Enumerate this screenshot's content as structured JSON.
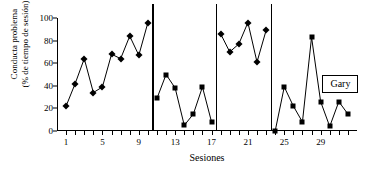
{
  "chart_data": {
    "type": "line",
    "title": "",
    "xlabel": "Sesiones",
    "ylabel": "Conducta problema (% de tiempo de sesión)",
    "ylabel_line1": "Conducta problema",
    "ylabel_line2": "(% de tiempo de sesión)",
    "xlim": [
      0,
      33
    ],
    "ylim": [
      0,
      100
    ],
    "yticks": [
      0,
      20,
      40,
      60,
      80,
      100
    ],
    "xticks_labeled": [
      1,
      5,
      9,
      13,
      17,
      21,
      25,
      29
    ],
    "xticks_all": [
      1,
      2,
      3,
      4,
      5,
      6,
      7,
      8,
      9,
      10,
      11,
      12,
      13,
      14,
      15,
      16,
      17,
      18,
      19,
      20,
      21,
      22,
      23,
      24,
      25,
      26,
      27,
      28,
      29,
      30,
      31,
      32
    ],
    "grid": false,
    "legend_position": "inside-right",
    "annotation": "Gary",
    "series": [
      {
        "name": "Conducta problema",
        "x": [
          1,
          2,
          3,
          4,
          5,
          6,
          7,
          8,
          9,
          10,
          11,
          12,
          13,
          14,
          15,
          16,
          17,
          18,
          19,
          20,
          21,
          22,
          23,
          24,
          25,
          26,
          27,
          28,
          29,
          30,
          31,
          32
        ],
        "values": [
          22,
          42,
          64,
          34,
          39,
          68,
          64,
          84,
          67,
          96,
          29,
          50,
          38,
          5,
          15,
          39,
          8,
          86,
          70,
          77,
          96,
          61,
          89,
          0,
          39,
          22,
          8,
          83,
          26,
          4,
          26,
          15
        ]
      }
    ],
    "phases": [
      {
        "label": "No E",
        "start": 1,
        "end": 10,
        "marker": "diamond"
      },
      {
        "label": "E",
        "start": 11,
        "end": 17,
        "marker": "square"
      },
      {
        "label": "No E",
        "start": 18,
        "end": 23,
        "marker": "diamond"
      },
      {
        "label": "E",
        "start": 24,
        "end": 32,
        "marker": "square"
      }
    ],
    "phase_dividers": [
      10.5,
      17.5,
      23.5
    ],
    "colors": {
      "line": "#000000",
      "marker": "#000000",
      "axis": "#000000"
    }
  }
}
